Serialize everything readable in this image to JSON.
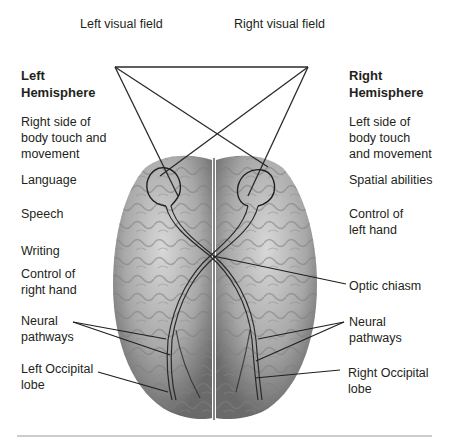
{
  "fields": {
    "left_visual_field": "Left visual field",
    "right_visual_field": "Right visual field"
  },
  "left": {
    "heading": "Left\nHemisphere",
    "functions": [
      "Right side of\nbody touch and\nmovement",
      "Language",
      "Speech",
      "Writing",
      "Control of\nright hand"
    ],
    "neural_pathways": "Neural\npathways",
    "occipital": "Left Occipital\nlobe"
  },
  "right": {
    "heading": "Right\nHemisphere",
    "functions": [
      "Left side of\nbody touch\nand movement",
      "Spatial abilities",
      "Control of\nleft hand"
    ],
    "optic_chiasm": "Optic chiasm",
    "neural_pathways": "Neural\npathways",
    "occipital": "Right Occipital\nlobe"
  },
  "colors": {
    "text": "#231f20",
    "line": "#2a2a2a",
    "brain_light": "#c9c9c9",
    "brain_dark": "#6e6e6e",
    "rule": "#9a9a9a"
  }
}
